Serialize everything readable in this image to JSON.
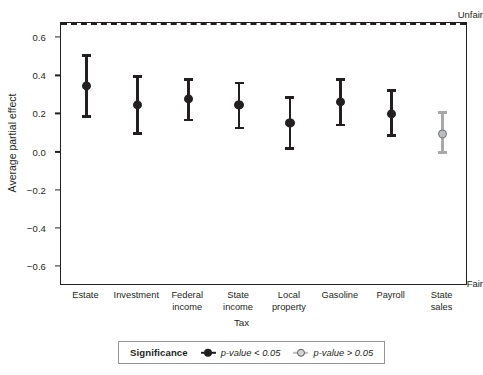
{
  "chart_data": {
    "type": "scatter",
    "title": "",
    "xlabel": "Tax",
    "ylabel": "Average partial effect",
    "ylim": [
      -0.7,
      0.68
    ],
    "yticks": [
      0.6,
      0.4,
      0.2,
      0.0,
      -0.2,
      -0.4,
      -0.6
    ],
    "ytick_labels": [
      "0.6",
      "0.4",
      "0.2",
      "0.0",
      "−0.2",
      "−0.4",
      "−0.6"
    ],
    "axis_anchor_high": "Unfair",
    "axis_anchor_low": "Fair",
    "grid": false,
    "reference_line": {
      "value": 0.0,
      "style": "dashed",
      "color": "#231f20"
    },
    "categories": [
      "Estate",
      "Investment",
      "Federal\nincome",
      "State\nincome",
      "Local\nproperty",
      "Gasoline",
      "Payroll",
      "State\nsales"
    ],
    "values": [
      0.35,
      0.25,
      0.28,
      0.25,
      0.155,
      0.265,
      0.205,
      0.1
    ],
    "ci_low": [
      0.19,
      0.1,
      0.17,
      0.13,
      0.02,
      0.145,
      0.09,
      0.0
    ],
    "ci_high": [
      0.51,
      0.4,
      0.385,
      0.365,
      0.29,
      0.385,
      0.325,
      0.21
    ],
    "significant": [
      true,
      true,
      true,
      true,
      true,
      true,
      true,
      false
    ],
    "colors": {
      "significant": "#231f20",
      "not_significant": "#a7a9ac",
      "not_significant_fill": "#bcbec0",
      "axis": "#231f20"
    }
  },
  "legend": {
    "position": "bottom",
    "title": "Significance",
    "entries": [
      {
        "label": "p-value < 0.05",
        "significant": true
      },
      {
        "label": "p-value > 0.05",
        "significant": false
      }
    ]
  }
}
